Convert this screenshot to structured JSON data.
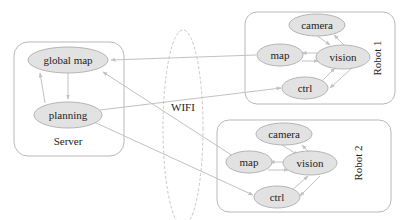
{
  "diagram": {
    "colors": {
      "node_fill": "#e2e2e2",
      "node_stroke": "#b5b5b5",
      "group_stroke": "#b8b8b8",
      "edge": "#c2c2c2",
      "text": "#222222"
    },
    "wifi": {
      "label": "WIFI"
    },
    "groups": [
      {
        "id": "server",
        "label": "Server",
        "nodes": [
          {
            "id": "global_map",
            "label": "global map"
          },
          {
            "id": "planning",
            "label": "planning"
          }
        ]
      },
      {
        "id": "robot1",
        "label": "Robot 1",
        "nodes": [
          {
            "id": "r1_camera",
            "label": "camera"
          },
          {
            "id": "r1_map",
            "label": "map"
          },
          {
            "id": "r1_vision",
            "label": "vision"
          },
          {
            "id": "r1_ctrl",
            "label": "ctrl"
          }
        ]
      },
      {
        "id": "robot2",
        "label": "Robot 2",
        "nodes": [
          {
            "id": "r2_camera",
            "label": "camera"
          },
          {
            "id": "r2_map",
            "label": "map"
          },
          {
            "id": "r2_vision",
            "label": "vision"
          },
          {
            "id": "r2_ctrl",
            "label": "ctrl"
          }
        ]
      }
    ],
    "edges": [
      {
        "from": "global_map",
        "to": "planning"
      },
      {
        "from": "planning",
        "to": "global_map"
      },
      {
        "from": "r1_map",
        "to": "global_map"
      },
      {
        "from": "r2_map",
        "to": "global_map"
      },
      {
        "from": "planning",
        "to": "r1_ctrl"
      },
      {
        "from": "planning",
        "to": "r2_ctrl"
      },
      {
        "from": "r1_camera",
        "to": "r1_vision"
      },
      {
        "from": "r1_vision",
        "to": "r1_camera"
      },
      {
        "from": "r1_vision",
        "to": "r1_map"
      },
      {
        "from": "r1_map",
        "to": "r1_vision"
      },
      {
        "from": "r1_ctrl",
        "to": "r1_vision"
      },
      {
        "from": "r1_vision",
        "to": "r1_ctrl"
      },
      {
        "from": "r2_camera",
        "to": "r2_vision"
      },
      {
        "from": "r2_vision",
        "to": "r2_camera"
      },
      {
        "from": "r2_vision",
        "to": "r2_map"
      },
      {
        "from": "r2_map",
        "to": "r2_vision"
      },
      {
        "from": "r2_ctrl",
        "to": "r2_vision"
      },
      {
        "from": "r2_vision",
        "to": "r2_ctrl"
      }
    ]
  }
}
